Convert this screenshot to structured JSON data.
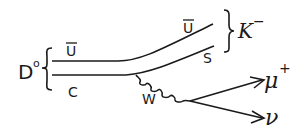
{
  "diagram": {
    "ink_color": "#1a1a1a",
    "background": "#ffffff",
    "initial_state": {
      "particle": "D",
      "superscript": "o",
      "quarks": [
        "ū",
        "c"
      ]
    },
    "final_meson": {
      "particle": "K",
      "superscript": "−",
      "quarks": [
        "ū",
        "s"
      ]
    },
    "labels": {
      "d_main": "D",
      "d_sup": "o",
      "u_bar_left": "U",
      "c_quark": "C",
      "u_bar_right": "U",
      "s_quark": "S",
      "k_main": "K",
      "k_sup": "−",
      "w_boson": "W",
      "muon": "μ",
      "muon_sup": "+",
      "neutrino": "ν"
    }
  }
}
